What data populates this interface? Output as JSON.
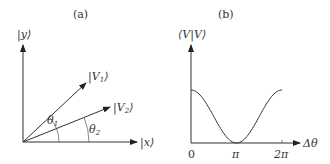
{
  "panel_a": {
    "title": "(a)",
    "y_axis_label": "|y⟩",
    "x_axis_label": "|x⟩",
    "vectors": [
      {
        "name": "V1",
        "label_base": "|V",
        "label_sub": "1",
        "label_end": "⟩",
        "angle_label": "θ",
        "angle_sub": "1"
      },
      {
        "name": "V2",
        "label_base": "|V",
        "label_sub": "2",
        "label_end": "⟩",
        "angle_label": "θ",
        "angle_sub": "2"
      }
    ]
  },
  "panel_b": {
    "title": "(b)",
    "y_axis_label": "⟨V|V⟩",
    "x_axis_label": "Δθ",
    "x_ticks": [
      "0",
      "π",
      "2π"
    ]
  },
  "chart_data": {
    "type": "line",
    "title": "(b)",
    "xlabel": "Δθ",
    "ylabel": "⟨V|V⟩",
    "x_tick_labels": [
      "0",
      "π",
      "2π"
    ],
    "x": [
      0,
      0.785,
      1.571,
      2.356,
      3.142,
      3.927,
      4.712,
      5.498,
      6.283
    ],
    "values": [
      1.0,
      0.85,
      0.5,
      0.15,
      0.0,
      0.15,
      0.5,
      0.85,
      1.0
    ],
    "xlim": [
      0,
      6.6
    ],
    "grid": false,
    "legend": "none"
  }
}
